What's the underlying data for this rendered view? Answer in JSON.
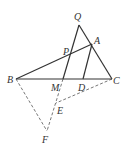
{
  "diagram": {
    "type": "geometry",
    "points": {
      "Q": {
        "label": "Q",
        "x": 79,
        "y": 25
      },
      "A": {
        "label": "A",
        "x": 92,
        "y": 44
      },
      "P": {
        "label": "P",
        "x": 70,
        "y": 56
      },
      "B": {
        "label": "B",
        "x": 16,
        "y": 79
      },
      "M": {
        "label": "M",
        "x": 63,
        "y": 79
      },
      "D": {
        "label": "D",
        "x": 83,
        "y": 79
      },
      "C": {
        "label": "C",
        "x": 112,
        "y": 79
      },
      "E": {
        "label": "E",
        "x": 56,
        "y": 103
      },
      "F": {
        "label": "F",
        "x": 47,
        "y": 131
      }
    },
    "solid_segments": [
      [
        "B",
        "C"
      ],
      [
        "B",
        "A"
      ],
      [
        "Q",
        "C"
      ],
      [
        "Q",
        "M"
      ],
      [
        "A",
        "D"
      ]
    ],
    "dashed_segments": [
      [
        "B",
        "F"
      ],
      [
        "M",
        "F"
      ],
      [
        "C",
        "E"
      ]
    ]
  }
}
